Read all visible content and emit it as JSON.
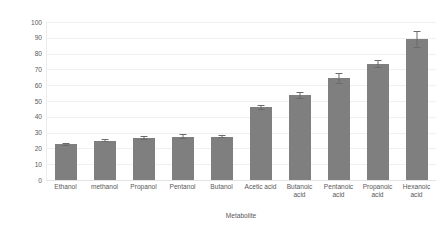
{
  "chart_data": {
    "type": "bar",
    "title": "",
    "xlabel": "Metabolite",
    "ylabel": "Average reduction (%)",
    "categories": [
      "Ethanol",
      "methanol",
      "Propanol",
      "Pentanol",
      "Butanol",
      "Acetic acid",
      "Butanoic acid",
      "Pentanoic acid",
      "Propanoic acid",
      "Hexanoic acid"
    ],
    "values": [
      22.5,
      25,
      26.5,
      27.5,
      27.5,
      46,
      53.5,
      64.5,
      73.5,
      89
    ],
    "errors": [
      1.2,
      1.2,
      1.5,
      1.5,
      1.2,
      1.5,
      2.5,
      3.5,
      2.5,
      5.5
    ],
    "ylim": [
      0,
      100
    ],
    "ytick_labels": [
      "100",
      "90",
      "80",
      "70",
      "60",
      "50",
      "40",
      "30",
      "20",
      "10",
      "0"
    ],
    "ytick_values": [
      100,
      90,
      80,
      70,
      60,
      50,
      40,
      30,
      20,
      10,
      0
    ],
    "grid": true,
    "legend": "none",
    "bar_color": "#7f7f7f",
    "gridline_color": "#f0f0f0",
    "text_color": "#595959",
    "error_bar_color": "#6b6b6b"
  }
}
